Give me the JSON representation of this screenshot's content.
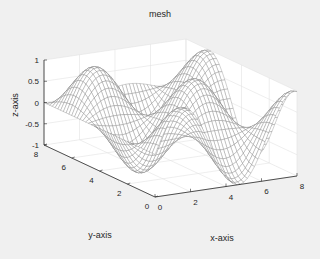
{
  "chart_data": {
    "type": "surface-mesh",
    "title": "mesh",
    "xlabel": "x-axis",
    "ylabel": "y-axis",
    "zlabel": "z-axis",
    "xlim": [
      0,
      8
    ],
    "ylim": [
      0,
      8
    ],
    "zlim": [
      -1,
      1
    ],
    "x_ticks": [
      "0",
      "2",
      "4",
      "6",
      "8"
    ],
    "y_ticks": [
      "0",
      "2",
      "4",
      "6",
      "8"
    ],
    "z_ticks": [
      "-1",
      "-0.5",
      "0",
      "0.5",
      "1"
    ],
    "function": "z = sin(x) * cos(y)",
    "grid_step": 0.2,
    "grid": true,
    "legend": null,
    "mesh_color": "#7a7a7a",
    "axis_color": "#262626",
    "background": "#f0f0f0",
    "axes_background": "#ffffff"
  }
}
